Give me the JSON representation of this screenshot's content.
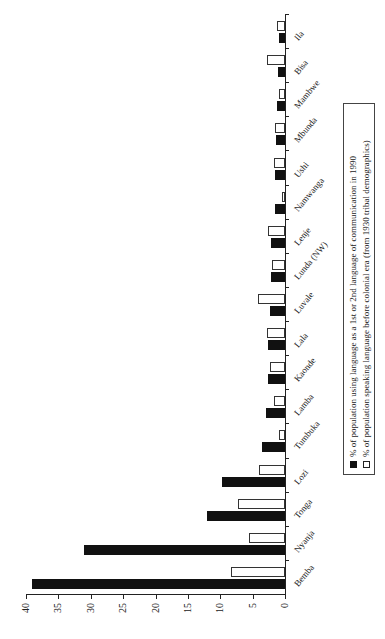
{
  "chart_data": {
    "type": "bar",
    "orientation": "vertical bars, figure rotated 90 degrees counter-clockwise on page",
    "title": "",
    "xlabel": "",
    "ylabel": "",
    "ylim": [
      0,
      40
    ],
    "yticks": [
      "0",
      "5",
      "10",
      "15",
      "20",
      "25",
      "30",
      "35",
      "40"
    ],
    "grid": false,
    "legend_position": "below plot (right side of page)",
    "categories": [
      "Bemba",
      "Nyanja",
      "Tonga",
      "Lozi",
      "Tumbuka",
      "Lamba",
      "Kaonde",
      "Lala",
      "Luvale",
      "Lunda (NW)",
      "Lenje",
      "Namwanga",
      "Ushi",
      "Mbunda",
      "Mambwe",
      "Bisa",
      "Ila"
    ],
    "series": [
      {
        "name": "% of population using language as a 1st or 2nd language of communication in 1990",
        "color": "#111111",
        "values": [
          39,
          31,
          12,
          9.8,
          3.6,
          3.0,
          2.7,
          2.6,
          2.3,
          2.2,
          2.1,
          1.6,
          1.5,
          1.4,
          1.2,
          1.1,
          1.0
        ]
      },
      {
        "name": "% of population speaking language before colonial era (from 1930 tribal demographics)",
        "color": "#ffffff",
        "values": [
          8.4,
          5.6,
          7.2,
          4.0,
          1.0,
          1.7,
          2.3,
          2.8,
          4.2,
          2.0,
          2.7,
          0.4,
          1.7,
          1.5,
          0.9,
          2.8,
          1.3
        ]
      }
    ]
  },
  "legend": {
    "items": [
      {
        "label": "% of population using language as a 1st or 2nd language of communication in 1990",
        "swatch": "black"
      },
      {
        "label": "% of population speaking language before colonial era (from 1930 tribal demographics)",
        "swatch": "white"
      }
    ]
  }
}
